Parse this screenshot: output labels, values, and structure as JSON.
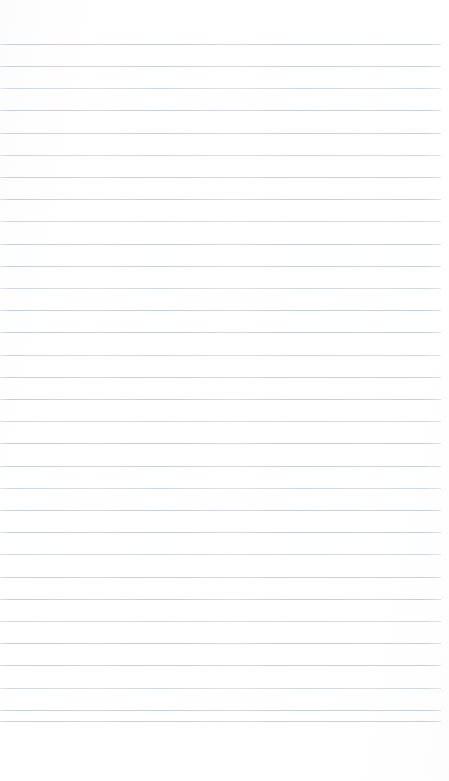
{
  "document": {
    "kind": "scanned-blank-ruled-paper",
    "page_width": 449,
    "page_height": 781,
    "background_color": "#ffffff",
    "has_text": false,
    "has_handwriting": false,
    "visible_text": ""
  },
  "ruling": {
    "line_color": "#c9ced4",
    "line_color_alt": "#d2d7dc",
    "line_thickness": 1,
    "line_count": 32,
    "first_line_y": 44,
    "line_spacing": 22.2,
    "line_start_x": 0,
    "line_end_x": 441,
    "right_margin": 8,
    "bottom_blank_from_y": 722,
    "lines": [
      {
        "index": 1,
        "y": 44,
        "x1": 0,
        "x2": 441
      },
      {
        "index": 2,
        "y": 66,
        "x1": 0,
        "x2": 441
      },
      {
        "index": 3,
        "y": 88,
        "x1": 0,
        "x2": 441
      },
      {
        "index": 4,
        "y": 110,
        "x1": 0,
        "x2": 441
      },
      {
        "index": 5,
        "y": 133,
        "x1": 0,
        "x2": 441
      },
      {
        "index": 6,
        "y": 155,
        "x1": 0,
        "x2": 441
      },
      {
        "index": 7,
        "y": 177,
        "x1": 0,
        "x2": 441
      },
      {
        "index": 8,
        "y": 199,
        "x1": 0,
        "x2": 441
      },
      {
        "index": 9,
        "y": 221,
        "x1": 0,
        "x2": 441
      },
      {
        "index": 10,
        "y": 244,
        "x1": 0,
        "x2": 441
      },
      {
        "index": 11,
        "y": 266,
        "x1": 0,
        "x2": 441
      },
      {
        "index": 12,
        "y": 288,
        "x1": 0,
        "x2": 441
      },
      {
        "index": 13,
        "y": 310,
        "x1": 0,
        "x2": 441
      },
      {
        "index": 14,
        "y": 332,
        "x1": 0,
        "x2": 441
      },
      {
        "index": 15,
        "y": 355,
        "x1": 0,
        "x2": 441
      },
      {
        "index": 16,
        "y": 377,
        "x1": 0,
        "x2": 441
      },
      {
        "index": 17,
        "y": 399,
        "x1": 0,
        "x2": 441
      },
      {
        "index": 18,
        "y": 421,
        "x1": 0,
        "x2": 441
      },
      {
        "index": 19,
        "y": 443,
        "x1": 0,
        "x2": 441
      },
      {
        "index": 20,
        "y": 466,
        "x1": 0,
        "x2": 441
      },
      {
        "index": 21,
        "y": 488,
        "x1": 0,
        "x2": 441
      },
      {
        "index": 22,
        "y": 510,
        "x1": 0,
        "x2": 441
      },
      {
        "index": 23,
        "y": 532,
        "x1": 0,
        "x2": 441
      },
      {
        "index": 24,
        "y": 554,
        "x1": 0,
        "x2": 441
      },
      {
        "index": 25,
        "y": 577,
        "x1": 0,
        "x2": 441
      },
      {
        "index": 26,
        "y": 599,
        "x1": 0,
        "x2": 441
      },
      {
        "index": 27,
        "y": 621,
        "x1": 0,
        "x2": 441
      },
      {
        "index": 28,
        "y": 643,
        "x1": 0,
        "x2": 441
      },
      {
        "index": 29,
        "y": 665,
        "x1": 0,
        "x2": 441
      },
      {
        "index": 30,
        "y": 688,
        "x1": 0,
        "x2": 441
      },
      {
        "index": 31,
        "y": 710,
        "x1": 0,
        "x2": 441
      },
      {
        "index": 32,
        "y": 721,
        "x1": 0,
        "x2": 441
      }
    ]
  }
}
